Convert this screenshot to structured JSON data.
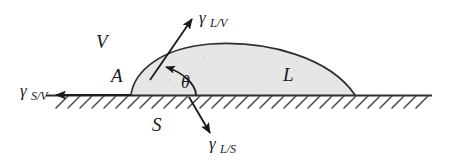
{
  "figure": {
    "phases": {
      "vapor": "V",
      "liquid": "L",
      "solid": "S",
      "contact_point": "A"
    },
    "angle": {
      "symbol": "θ",
      "name": "contact-angle"
    },
    "tensions": [
      {
        "id": "gamma-sv",
        "symbol": "γ",
        "subscript": "S/V",
        "direction": "left",
        "description": "solid-vapor interfacial tension"
      },
      {
        "id": "gamma-lv",
        "symbol": "γ",
        "subscript": "L/V",
        "direction": "up-right",
        "description": "liquid-vapor interfacial tension, tangent to drop surface"
      },
      {
        "id": "gamma-ls",
        "symbol": "γ",
        "subscript": "L/S",
        "direction": "down-right",
        "description": "liquid-solid interfacial tension"
      }
    ],
    "colors": {
      "ink": "#1a1a1a",
      "stroke": "#3b3b3b",
      "drop_fill": "#e6e6e6",
      "background": "#ffffff",
      "hatch": "#555555"
    }
  }
}
